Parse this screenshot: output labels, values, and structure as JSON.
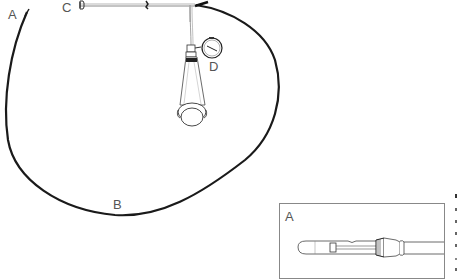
{
  "figure": {
    "colors": {
      "line": "#1a1a1a",
      "label": "#555555",
      "background": "#ffffff"
    }
  },
  "labels": {
    "a": "A",
    "b": "B",
    "c": "C",
    "d": "D"
  },
  "inset": {
    "label": "A",
    "content": "Enlarged tip of catheter A"
  }
}
